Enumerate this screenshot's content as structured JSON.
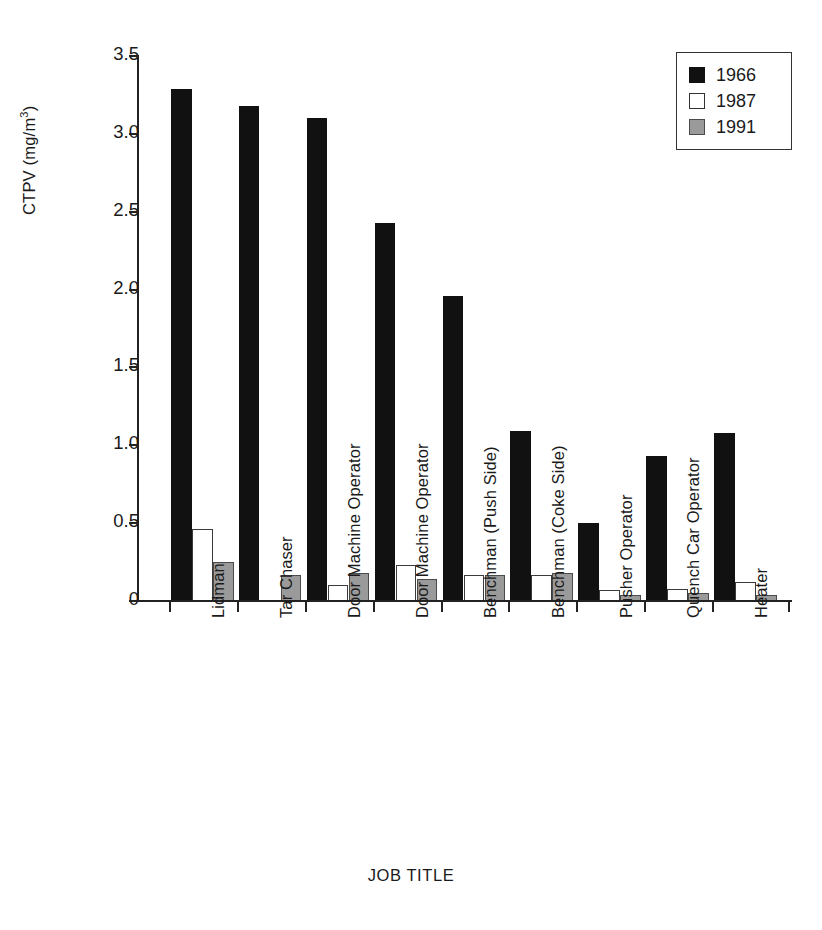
{
  "chart_data": {
    "type": "bar",
    "title": "",
    "xlabel": "JOB TITLE",
    "ylabel": "CTPV (mg/m3)",
    "ylabel_parts": {
      "main": "CTPV (mg/m",
      "sup": "3",
      "tail": ")"
    },
    "ylim": [
      0,
      3.5
    ],
    "yticks": [
      "0",
      "0.5",
      "1.0",
      "1.5",
      "2.0",
      "2.5",
      "3.0",
      "3.5"
    ],
    "ytick_values": [
      0,
      0.5,
      1.0,
      1.5,
      2.0,
      2.5,
      3.0,
      3.5
    ],
    "grid": false,
    "legend_position": "top-right",
    "categories": [
      "Lidman",
      "Tar Chaser",
      "Door Machine Operator",
      "Door Machine Operator",
      "Benchman (Push Side)",
      "Benchman (Coke Side)",
      "Pusher Operator",
      "Quench Car Operator",
      "Heater"
    ],
    "series": [
      {
        "name": "1966",
        "color": "#111111",
        "values": [
          3.29,
          3.18,
          3.1,
          2.43,
          1.96,
          1.09,
          0.5,
          0.93,
          1.08
        ]
      },
      {
        "name": "1987",
        "color": "#ffffff",
        "values": [
          0.46,
          0.0,
          0.1,
          0.23,
          0.17,
          0.17,
          0.07,
          0.08,
          0.12
        ]
      },
      {
        "name": "1991",
        "color": "#9a9a9a",
        "values": [
          0.25,
          0.17,
          0.18,
          0.14,
          0.17,
          0.18,
          0.04,
          0.05,
          0.04
        ]
      }
    ]
  },
  "legend": {
    "items": [
      {
        "label": "1966",
        "swatch": "black-square-swatch"
      },
      {
        "label": "1987",
        "swatch": "white-square-swatch"
      },
      {
        "label": "1991",
        "swatch": "gray-square-swatch"
      }
    ]
  }
}
